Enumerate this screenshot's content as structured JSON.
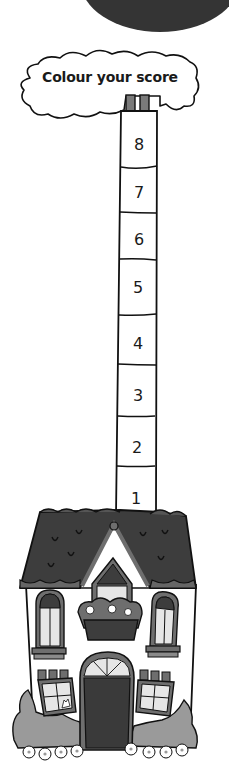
{
  "title": "Colour your score",
  "chimney": {
    "steps": [
      {
        "label": "8",
        "y": 144
      },
      {
        "label": "7",
        "y": 192
      },
      {
        "label": "6",
        "y": 239
      },
      {
        "label": "5",
        "y": 287
      },
      {
        "label": "4",
        "y": 343
      },
      {
        "label": "3",
        "y": 395
      },
      {
        "label": "2",
        "y": 447
      },
      {
        "label": "1",
        "y": 498
      }
    ]
  },
  "colors": {
    "dark_circle": "#333333",
    "roof": "#3d3d3d",
    "trim": "#6e6e6e",
    "window_glass": "#e6e6e6",
    "door": "#3a3a3a",
    "bush": "#9a9a9a",
    "line": "#111111"
  }
}
